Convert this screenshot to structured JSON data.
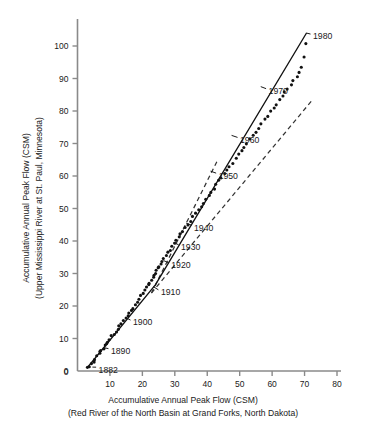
{
  "chart_data": {
    "type": "scatter",
    "title": "",
    "xlabel": "Accumulative Annual Peak Flow (CSM)",
    "xlabel2": "(Red River of the North Basin at Grand Forks, North Dakota)",
    "ylabel": "Accumulative Annual Peak Flow (CSM)",
    "ylabel2": "(Upper Mississippi River at St. Paul, Minnesota)",
    "xlim": [
      0,
      80
    ],
    "ylim": [
      0,
      108
    ],
    "xticks": [
      0,
      10,
      20,
      30,
      40,
      50,
      60,
      70,
      80
    ],
    "yticks": [
      0,
      10,
      20,
      30,
      40,
      50,
      60,
      70,
      80,
      90,
      100
    ],
    "grid": false,
    "legend": "none",
    "series": [
      {
        "name": "Double mass curve points",
        "marker": "filled-circle",
        "color": "#111111",
        "x": [
          3.0,
          3.6,
          4.2,
          4.9,
          5.5,
          6.1,
          6.6,
          7.0,
          7.4,
          7.9,
          8.4,
          8.9,
          9.4,
          10.0,
          10.6,
          11.2,
          11.8,
          12.4,
          13.0,
          13.6,
          14.2,
          14.8,
          15.4,
          16.0,
          16.6,
          17.2,
          17.8,
          18.4,
          19.0,
          19.6,
          20.2,
          20.8,
          21.3,
          21.8,
          22.3,
          22.8,
          23.2,
          23.6,
          24.0,
          24.4,
          24.8,
          25.2,
          25.6,
          26.1,
          26.6,
          27.2,
          27.8,
          28.4,
          29.1,
          29.8,
          30.5,
          31.2,
          31.9,
          32.6,
          33.3,
          34.0,
          34.8,
          35.6,
          36.4,
          37.2,
          38.0,
          38.8,
          39.6,
          40.4,
          41.2,
          42.0,
          42.8,
          43.6,
          44.4,
          45.2,
          46.0,
          46.9,
          47.8,
          48.7,
          49.6,
          50.5,
          51.4,
          52.3,
          53.2,
          54.1,
          55.0,
          55.9,
          56.8,
          57.7,
          58.6,
          59.5,
          60.4,
          61.3,
          62.2,
          63.1,
          64.0,
          64.9,
          65.8,
          66.7,
          67.6,
          68.5,
          69.2,
          69.8,
          70.3
        ],
        "y": [
          1.0,
          1.6,
          2.3,
          3.0,
          3.8,
          4.5,
          5.2,
          5.8,
          6.4,
          7.0,
          7.7,
          8.4,
          9.1,
          9.8,
          10.6,
          11.4,
          12.2,
          13.0,
          13.8,
          14.6,
          15.4,
          16.2,
          17.0,
          17.8,
          18.6,
          19.4,
          20.3,
          21.2,
          22.1,
          23.0,
          23.9,
          24.8,
          25.6,
          26.4,
          27.2,
          28.0,
          28.7,
          29.4,
          30.1,
          30.8,
          31.5,
          32.2,
          32.9,
          33.7,
          34.5,
          35.4,
          36.3,
          37.2,
          38.2,
          39.2,
          40.2,
          41.2,
          42.2,
          43.2,
          44.2,
          45.2,
          46.3,
          47.4,
          48.5,
          49.6,
          50.7,
          51.8,
          52.9,
          54.0,
          55.1,
          56.2,
          57.3,
          58.4,
          59.5,
          60.6,
          61.7,
          62.9,
          64.1,
          65.3,
          66.5,
          67.7,
          68.9,
          70.1,
          71.3,
          72.5,
          73.7,
          74.9,
          76.1,
          77.3,
          78.5,
          79.7,
          80.9,
          82.1,
          83.3,
          84.5,
          85.7,
          86.9,
          88.1,
          89.3,
          90.5,
          91.7,
          93.5,
          96.5,
          100.5
        ]
      }
    ],
    "trend_line": {
      "name": "double-mass trend",
      "style": "solid",
      "color": "#111111",
      "points": [
        [
          3.0,
          1.0
        ],
        [
          24.0,
          26.5
        ],
        [
          70.6,
          104.0
        ]
      ]
    },
    "reference_lines": [
      {
        "name": "steep dashed reference",
        "style": "dashed",
        "color": "#333333",
        "points": [
          [
            22.8,
            24.0
          ],
          [
            43.0,
            64.5
          ]
        ]
      },
      {
        "name": "shallow dashed reference",
        "style": "dashed",
        "color": "#333333",
        "points": [
          [
            22.8,
            24.0
          ],
          [
            72.5,
            83.5
          ]
        ]
      }
    ],
    "annotations": [
      {
        "label": "1882",
        "x": 4.6,
        "y": 1.2,
        "lx": 6.2,
        "ly": 0.5
      },
      {
        "label": "1890",
        "x": 8.1,
        "y": 7.2,
        "lx": 10.0,
        "ly": 6.2
      },
      {
        "label": "1900",
        "x": 15.1,
        "y": 16.3,
        "lx": 16.8,
        "ly": 15.0
      },
      {
        "label": "1910",
        "x": 23.3,
        "y": 26.0,
        "lx": 25.4,
        "ly": 24.3
      },
      {
        "label": "1920",
        "x": 26.5,
        "y": 34.0,
        "lx": 28.6,
        "ly": 32.6
      },
      {
        "label": "1930",
        "x": 29.5,
        "y": 39.5,
        "lx": 31.6,
        "ly": 38.2
      },
      {
        "label": "1940",
        "x": 33.5,
        "y": 45.5,
        "lx": 35.6,
        "ly": 44.2
      },
      {
        "label": "1950",
        "x": 41.0,
        "y": 61.5,
        "lx": 43.2,
        "ly": 60.2
      },
      {
        "label": "1960",
        "x": 47.5,
        "y": 72.5,
        "lx": 49.8,
        "ly": 71.2
      },
      {
        "label": "1970",
        "x": 56.5,
        "y": 87.5,
        "lx": 58.6,
        "ly": 86.2
      },
      {
        "label": "1980",
        "x": 70.5,
        "y": 104.0,
        "lx": 72.3,
        "ly": 103.0
      }
    ]
  }
}
